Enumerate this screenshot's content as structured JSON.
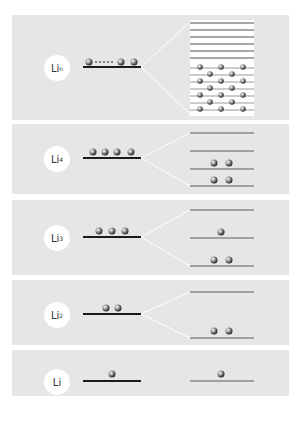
{
  "diagram": {
    "colors": {
      "panel_bg": "#e6e6e6",
      "atomic_level": "#1a1a1a",
      "split_level": "#8a8a8a",
      "connector": "#ffffff",
      "label_bg": "#ffffff"
    },
    "rows": [
      {
        "id": "lin",
        "label": "Li",
        "subscript": "n",
        "atomic_electrons": "many (dotted)",
        "split_levels": 15,
        "filled_description": "lower half of band filled"
      },
      {
        "id": "li4",
        "label": "Li",
        "subscript": "4",
        "atomic_electrons": 4,
        "split_levels": 4,
        "occupancy": [
          0,
          0,
          2,
          2
        ]
      },
      {
        "id": "li3",
        "label": "Li",
        "subscript": "3",
        "atomic_electrons": 3,
        "split_levels": 3,
        "occupancy": [
          0,
          1,
          2
        ]
      },
      {
        "id": "li2",
        "label": "Li",
        "subscript": "2",
        "atomic_electrons": 2,
        "split_levels": 2,
        "occupancy": [
          0,
          2
        ]
      },
      {
        "id": "li1",
        "label": "Li",
        "subscript": "",
        "atomic_electrons": 1,
        "split_levels": 1,
        "occupancy": [
          1
        ]
      }
    ]
  }
}
